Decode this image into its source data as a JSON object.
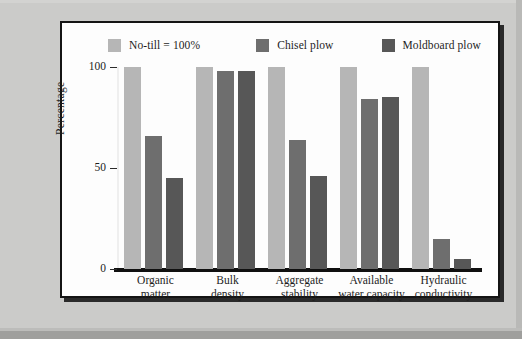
{
  "chart_data": {
    "type": "bar",
    "title": "",
    "subtitle": "",
    "xlabel": "",
    "ylabel": "Percentage",
    "ylim": [
      0,
      100
    ],
    "yticks": [
      0,
      50,
      100
    ],
    "ytick_labels": [
      "0",
      "50",
      "100"
    ],
    "grid": false,
    "legend_position": "top",
    "categories": [
      "Organic matter",
      "Bulk density",
      "Aggregate stability",
      "Available water capacity",
      "Hydraulic conductivity"
    ],
    "category_lines": [
      [
        "Organic",
        "matter"
      ],
      [
        "Bulk",
        "density"
      ],
      [
        "Aggregate",
        "stability"
      ],
      [
        "Available",
        "water capacity"
      ],
      [
        "Hydraulic",
        "conductivity"
      ]
    ],
    "series": [
      {
        "name": "No-till = 100%",
        "color": "#b6b6b6",
        "values": [
          100,
          100,
          100,
          100,
          100
        ]
      },
      {
        "name": "Chisel plow",
        "color": "#6e6e6e",
        "values": [
          66,
          98,
          64,
          84,
          15
        ]
      },
      {
        "name": "Moldboard plow",
        "color": "#575757",
        "values": [
          45,
          98,
          46,
          85,
          5
        ]
      }
    ],
    "annotations": []
  },
  "legend": {
    "items": [
      {
        "label": "No-till = 100%",
        "swatch_color": "#b6b6b6"
      },
      {
        "label": "Chisel plow",
        "swatch_color": "#6e6e6e"
      },
      {
        "label": "Moldboard plow",
        "swatch_color": "#575757"
      }
    ]
  },
  "axes": {
    "y_label": "Percentage",
    "y_ticks": [
      "100",
      "50",
      "0"
    ]
  }
}
